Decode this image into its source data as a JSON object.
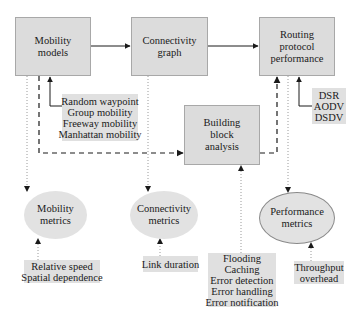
{
  "diagram": {
    "nodes": {
      "mobility_models": {
        "lines": [
          "Mobility",
          "models"
        ]
      },
      "connectivity_graph": {
        "lines": [
          "Connectivity",
          "graph"
        ]
      },
      "routing_performance": {
        "lines": [
          "Routing",
          "protocol",
          "performance"
        ]
      },
      "building_block": {
        "lines": [
          "Building",
          "block",
          "analysis"
        ]
      },
      "mobility_metrics": {
        "lines": [
          "Mobility",
          "metrics"
        ]
      },
      "connectivity_metrics": {
        "lines": [
          "Connectivity",
          "metrics"
        ]
      },
      "performance_metrics": {
        "lines": [
          "Performance",
          "metrics"
        ]
      }
    },
    "notes": {
      "mobility_model_types": {
        "lines": [
          "Random waypoint",
          "Group mobility",
          "Freeway mobility",
          "Manhattan mobility"
        ]
      },
      "protocols": {
        "lines": [
          "DSR",
          "AODV",
          "DSDV"
        ]
      },
      "mobility_metric_types": {
        "lines": [
          "Relative speed",
          "Spatial dependence"
        ]
      },
      "connectivity_metric_types": {
        "lines": [
          "Link duration"
        ]
      },
      "building_blocks": {
        "lines": [
          "Flooding",
          "Caching",
          "Error detection",
          "Error handling",
          "Error notification"
        ]
      },
      "performance_metric_types": {
        "lines": [
          "Throughput",
          "overhead"
        ]
      }
    },
    "edges": [
      {
        "from": "mobility_models",
        "to": "connectivity_graph",
        "style": "solid"
      },
      {
        "from": "connectivity_graph",
        "to": "routing_performance",
        "style": "solid"
      },
      {
        "from": "mobility_model_types",
        "to": "mobility_models",
        "style": "solid"
      },
      {
        "from": "protocols",
        "to": "routing_performance",
        "style": "solid"
      },
      {
        "from": "mobility_models",
        "to": "building_block",
        "style": "dashed"
      },
      {
        "from": "building_block",
        "to": "routing_performance",
        "style": "dashed"
      },
      {
        "from": "mobility_models",
        "to": "mobility_metrics",
        "style": "dotted"
      },
      {
        "from": "connectivity_graph",
        "to": "connectivity_metrics",
        "style": "dotted"
      },
      {
        "from": "routing_performance",
        "to": "performance_metrics",
        "style": "dotted"
      },
      {
        "from": "mobility_metric_types",
        "to": "mobility_metrics",
        "style": "dotted"
      },
      {
        "from": "connectivity_metric_types",
        "to": "connectivity_metrics",
        "style": "dotted"
      },
      {
        "from": "building_blocks",
        "to": "building_block",
        "style": "dotted"
      },
      {
        "from": "performance_metric_types",
        "to": "performance_metrics",
        "style": "dotted"
      }
    ],
    "colors": {
      "box_fill": "#dcdcdc",
      "box_border": "#a8a8a8",
      "note_fill": "#e0e0e0",
      "ellipse_fill": "#e2e2e2",
      "line": "#1a1a1a",
      "dotted_line": "#9a9a9a"
    }
  }
}
